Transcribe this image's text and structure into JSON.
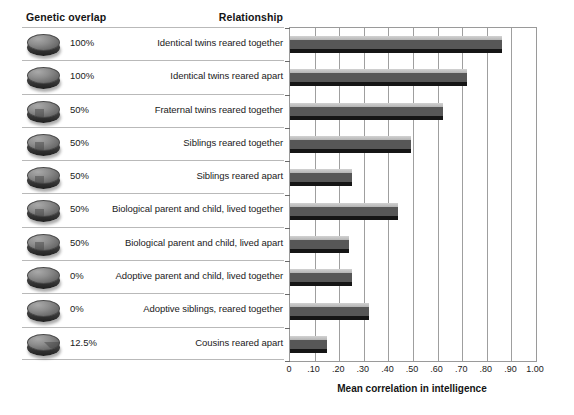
{
  "headers": {
    "genetic_overlap": "Genetic overlap",
    "relationship": "Relationship"
  },
  "axis": {
    "xlabel": "Mean correlation in intelligence",
    "ticks": [
      "0",
      ".10",
      ".20",
      ".30",
      ".40",
      ".50",
      ".60",
      ".70",
      ".80",
      ".90",
      "1.00"
    ],
    "tick_values": [
      0,
      0.1,
      0.2,
      0.3,
      0.4,
      0.5,
      0.6,
      0.7,
      0.8,
      0.9,
      1.0
    ],
    "xlim": [
      0,
      1.0
    ]
  },
  "colors": {
    "bar_top": "#c8c8c8",
    "bar_body": "#575757",
    "bar_shadow": "#151515",
    "gridline": "#9f9f9f",
    "rule": "#b9b9b9",
    "text": "#1a1a1a"
  },
  "chart_data": {
    "type": "bar",
    "orientation": "horizontal",
    "title": "",
    "xlabel": "Mean correlation in intelligence",
    "ylabel": "",
    "xlim": [
      0,
      1.0
    ],
    "grid": true,
    "legend": false,
    "categories": [
      "Identical twins reared together",
      "Identical twins reared apart",
      "Fraternal twins reared together",
      "Siblings reared together",
      "Siblings reared apart",
      "Biological parent and child, lived together",
      "Biological parent and child, lived apart",
      "Adoptive parent and child, lived together",
      "Adoptive siblings, reared together",
      "Cousins reared apart"
    ],
    "values": [
      0.86,
      0.72,
      0.62,
      0.49,
      0.25,
      0.44,
      0.24,
      0.25,
      0.32,
      0.15
    ],
    "genetic_overlap": [
      "100%",
      "100%",
      "50%",
      "50%",
      "50%",
      "50%",
      "50%",
      "0%",
      "0%",
      "12.5%"
    ],
    "genetic_overlap_fraction": [
      1.0,
      1.0,
      0.5,
      0.5,
      0.5,
      0.5,
      0.5,
      0.0,
      0.0,
      0.125
    ]
  },
  "rows": [
    {
      "icon": "genetic-disc-icon",
      "pct": "100%",
      "frac": 1.0,
      "label": "Identical twins reared together",
      "value": 0.86
    },
    {
      "icon": "genetic-disc-icon",
      "pct": "100%",
      "frac": 1.0,
      "label": "Identical twins reared apart",
      "value": 0.72
    },
    {
      "icon": "genetic-disc-icon",
      "pct": "50%",
      "frac": 0.5,
      "label": "Fraternal twins reared together",
      "value": 0.62
    },
    {
      "icon": "genetic-disc-icon",
      "pct": "50%",
      "frac": 0.5,
      "label": "Siblings reared together",
      "value": 0.49
    },
    {
      "icon": "genetic-disc-icon",
      "pct": "50%",
      "frac": 0.5,
      "label": "Siblings reared apart",
      "value": 0.25
    },
    {
      "icon": "genetic-disc-icon",
      "pct": "50%",
      "frac": 0.5,
      "label": "Biological parent and child, lived together",
      "value": 0.44
    },
    {
      "icon": "genetic-disc-icon",
      "pct": "50%",
      "frac": 0.5,
      "label": "Biological parent and child, lived apart",
      "value": 0.24
    },
    {
      "icon": "genetic-disc-icon",
      "pct": "0%",
      "frac": 0.0,
      "label": "Adoptive parent and child, lived together",
      "value": 0.25
    },
    {
      "icon": "genetic-disc-icon",
      "pct": "0%",
      "frac": 0.0,
      "label": "Adoptive siblings, reared together",
      "value": 0.32
    },
    {
      "icon": "genetic-disc-icon",
      "pct": "12.5%",
      "frac": 0.125,
      "label": "Cousins reared apart",
      "value": 0.15
    }
  ]
}
